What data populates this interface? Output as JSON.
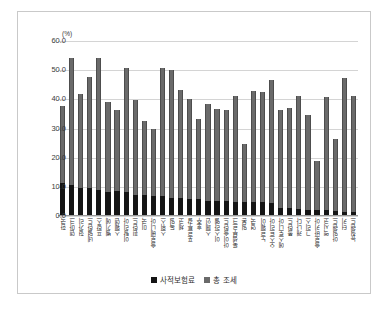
{
  "chart_data": {
    "type": "bar",
    "stacked": true,
    "title": "",
    "xlabel": "",
    "ylabel": "(%)",
    "unit_label": "(%)",
    "ylim": [
      0,
      60
    ],
    "ytick_values": [
      0,
      10,
      20,
      30,
      40,
      50,
      60
    ],
    "ytick_labels": [
      "0.0",
      "10.0",
      "20.0",
      "30.0",
      "40.0",
      "50.0",
      "60.0"
    ],
    "grid": true,
    "legend_position": "bottom",
    "categories": [
      "한국",
      "덴마크",
      "헝가리",
      "네덜란드",
      "프랑스",
      "벨기에",
      "스웨덴",
      "이탈리아",
      "핀란드",
      "미국",
      "슬로베니아",
      "스위스",
      "독일",
      "체코",
      "포르투갈",
      "호주",
      "스페인",
      "이스라엘",
      "아이슬란드",
      "룩셈부르크",
      "일본",
      "영국",
      "노르웨이",
      "오스트리아",
      "에스토니아",
      "폴란드",
      "캐나다",
      "그리스",
      "슬로바키아",
      "멕시코",
      "아일랜드",
      "터키",
      "뉴질랜드"
    ],
    "series": [
      {
        "name": "사적보험료",
        "color": "#151515",
        "values": [
          11.4,
          10.5,
          9.5,
          9.5,
          8.9,
          8.4,
          8.5,
          8.3,
          7.2,
          7.1,
          6.8,
          6.8,
          6.2,
          6.1,
          5.9,
          5.7,
          5.2,
          5.1,
          5.1,
          4.9,
          4.8,
          4.7,
          4.8,
          4.4,
          2.8,
          2.8,
          2.4,
          2.2,
          2.0,
          2.1,
          1.8,
          1.4,
          1.3
        ]
      },
      {
        "name": "총 조세",
        "color": "#6a6a6a",
        "values": [
          37.7,
          54.3,
          42.0,
          47.8,
          54.2,
          39.0,
          36.3,
          50.7,
          39.8,
          32.7,
          30.0,
          50.6,
          50.0,
          43.3,
          40.2,
          33.3,
          38.4,
          36.7,
          36.3,
          41.2,
          24.8,
          43.0,
          42.6,
          46.7,
          36.2,
          37.0,
          41.2,
          34.5,
          18.8,
          40.8,
          26.5,
          47.3,
          41.0
        ]
      }
    ],
    "legend": [
      {
        "label": "사적보험료",
        "color": "#151515"
      },
      {
        "label": "총 조세",
        "color": "#6a6a6a"
      }
    ]
  }
}
